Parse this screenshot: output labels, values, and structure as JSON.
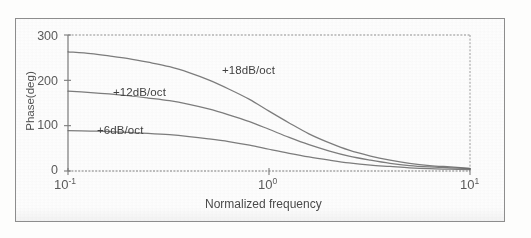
{
  "figure": {
    "kind": "scanned-bode-phase-plot",
    "border_color": "#8d8d8d",
    "background_color": "#fefefe",
    "ink_color": "#6a6a6a"
  },
  "axes": {
    "y_label": "Phase(deg)",
    "y_ticks": [
      "0",
      "100",
      "200",
      "300"
    ],
    "y_tick_values": [
      0,
      100,
      200,
      300
    ],
    "y_min": 0,
    "y_max": 300,
    "x_label": "Normalized frequency",
    "x_ticks": [
      {
        "base": "10",
        "exp": "-1",
        "value": 0.1
      },
      {
        "base": "10",
        "exp": "0",
        "value": 1
      },
      {
        "base": "10",
        "exp": "1",
        "value": 10
      }
    ],
    "x_min": 0.1,
    "x_max": 10,
    "x_scale": "log"
  },
  "annotations": [
    {
      "name": "curve-label-18db",
      "text": "+18dB/oct",
      "x_px": 222,
      "y_px": 64
    },
    {
      "name": "curve-label-12db",
      "text": "+12dB/oct",
      "x_px": 113,
      "y_px": 86
    },
    {
      "name": "curve-label-6db",
      "text": "+6dB/oct",
      "x_px": 97,
      "y_px": 124
    }
  ],
  "chart_data": {
    "type": "line",
    "title": "",
    "xlabel": "Normalized frequency",
    "ylabel": "Phase(deg)",
    "xscale": "log",
    "xlim": [
      0.1,
      10
    ],
    "ylim": [
      0,
      300
    ],
    "grid": false,
    "legend_position": "inline-annotations",
    "x": [
      0.1,
      0.13,
      0.16,
      0.2,
      0.25,
      0.32,
      0.4,
      0.5,
      0.63,
      0.8,
      1.0,
      1.26,
      1.58,
      2.0,
      2.5,
      3.2,
      4.0,
      5.0,
      6.3,
      8.0,
      10.0
    ],
    "series": [
      {
        "name": "+18dB/oct",
        "label": "+18dB/oct",
        "color": "#6a6a6a",
        "values": [
          263,
          259,
          254,
          248,
          240,
          230,
          217,
          201,
          181,
          158,
          132,
          106,
          82,
          62,
          46,
          33,
          24,
          17,
          12,
          9,
          6
        ]
      },
      {
        "name": "+12dB/oct",
        "label": "+12dB/oct",
        "color": "#6a6a6a",
        "values": [
          176,
          173,
          170,
          166,
          161,
          155,
          147,
          137,
          124,
          109,
          92,
          74,
          58,
          44,
          33,
          24,
          17,
          12,
          9,
          7,
          5
        ]
      },
      {
        "name": "+6dB/oct",
        "label": "+6dB/oct",
        "color": "#6a6a6a",
        "values": [
          89,
          88,
          87,
          85,
          83,
          80,
          76,
          71,
          65,
          57,
          48,
          39,
          31,
          24,
          18,
          13,
          10,
          7,
          5,
          4,
          3
        ]
      }
    ]
  }
}
